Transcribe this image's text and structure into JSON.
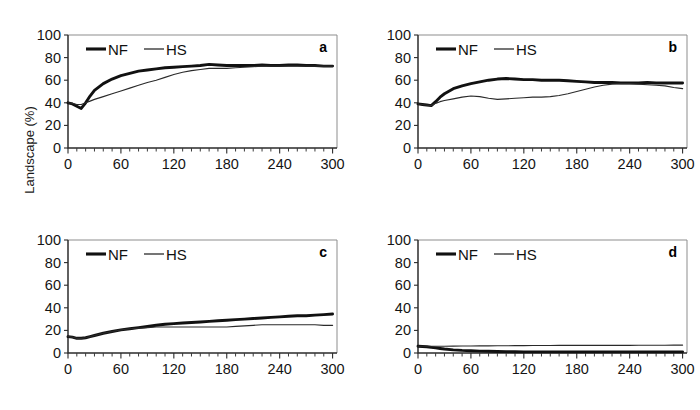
{
  "figure": {
    "ylabel": "Landscape (%)",
    "background_color": "#ffffff",
    "nf_color": "#111111",
    "hs_color": "#2a2a2a",
    "frame_color": "#8d8d8d"
  },
  "chart_data": [
    {
      "type": "line",
      "panel": "a",
      "title": "",
      "xlabel": "",
      "ylabel": "Landscape (%)",
      "xlim": [
        0,
        305
      ],
      "ylim": [
        0,
        100
      ],
      "xticks": [
        0,
        60,
        120,
        180,
        240,
        300
      ],
      "xtick_labels": [
        "0",
        "60",
        "120",
        "180",
        "240",
        "300"
      ],
      "xminor_step": 10,
      "yticks": [
        0,
        20,
        40,
        60,
        80,
        100
      ],
      "ytick_labels": [
        "0",
        "20",
        "40",
        "60",
        "80",
        "100"
      ],
      "grid": false,
      "legend_position": "top-left",
      "legend": [
        "NF",
        "HS"
      ],
      "x": [
        0,
        5,
        10,
        15,
        20,
        25,
        30,
        40,
        50,
        60,
        70,
        80,
        90,
        100,
        110,
        120,
        130,
        140,
        150,
        160,
        170,
        180,
        190,
        200,
        210,
        220,
        230,
        240,
        250,
        260,
        270,
        280,
        290,
        300
      ],
      "series": [
        {
          "name": "NF",
          "values": [
            40,
            39,
            37,
            35,
            40,
            46,
            51,
            57,
            61,
            64,
            66,
            68,
            69,
            70,
            71,
            71.5,
            72,
            72.5,
            73,
            74,
            73.5,
            73,
            73,
            73,
            73,
            73.5,
            73,
            73,
            73.5,
            73.5,
            73,
            73,
            72.5,
            72.5
          ]
        },
        {
          "name": "HS",
          "values": [
            40,
            39.5,
            38.5,
            38.5,
            40,
            41.5,
            43,
            45.5,
            48,
            50.5,
            53,
            55.5,
            58,
            60,
            62.5,
            65,
            67,
            68.5,
            69.5,
            70.5,
            70.5,
            70.5,
            71,
            71.5,
            72,
            72.5,
            72.5,
            72.5,
            72.5,
            72.5,
            72.5,
            72.5,
            72.5,
            72.5
          ]
        }
      ]
    },
    {
      "type": "line",
      "panel": "b",
      "title": "",
      "xlabel": "",
      "ylabel": "",
      "xlim": [
        0,
        305
      ],
      "ylim": [
        0,
        100
      ],
      "xticks": [
        0,
        60,
        120,
        180,
        240,
        300
      ],
      "xtick_labels": [
        "0",
        "60",
        "120",
        "180",
        "240",
        "300"
      ],
      "xminor_step": 10,
      "yticks": [
        0,
        20,
        40,
        60,
        80,
        100
      ],
      "ytick_labels": [
        "0",
        "20",
        "40",
        "60",
        "80",
        "100"
      ],
      "grid": false,
      "legend_position": "top-left",
      "legend": [
        "NF",
        "HS"
      ],
      "x": [
        0,
        5,
        10,
        15,
        20,
        25,
        30,
        40,
        50,
        60,
        70,
        80,
        90,
        100,
        110,
        120,
        130,
        140,
        150,
        160,
        170,
        180,
        190,
        200,
        210,
        220,
        230,
        240,
        250,
        260,
        270,
        280,
        290,
        300
      ],
      "series": [
        {
          "name": "NF",
          "values": [
            39,
            38.5,
            38,
            37.5,
            41,
            45,
            48,
            52.5,
            55,
            57,
            58.5,
            60,
            61,
            61.5,
            61,
            60.5,
            60.5,
            60,
            60,
            60,
            59.5,
            59,
            58.5,
            58,
            58,
            58,
            57.5,
            57.5,
            57.5,
            58,
            57.5,
            57.5,
            57.5,
            57.5
          ]
        },
        {
          "name": "HS",
          "values": [
            39,
            38.5,
            38,
            37.5,
            39.5,
            41,
            42,
            43.5,
            45,
            46,
            45.5,
            44,
            43,
            43.5,
            44,
            44.5,
            45,
            45,
            45.5,
            46.5,
            48,
            50,
            52,
            54,
            55.5,
            56.5,
            57,
            57,
            56.5,
            56,
            55.5,
            55,
            53.5,
            52.5
          ]
        }
      ]
    },
    {
      "type": "line",
      "panel": "c",
      "title": "",
      "xlabel": "",
      "ylabel": "",
      "xlim": [
        0,
        305
      ],
      "ylim": [
        0,
        100
      ],
      "xticks": [
        0,
        60,
        120,
        180,
        240,
        300
      ],
      "xtick_labels": [
        "0",
        "60",
        "120",
        "180",
        "240",
        "300"
      ],
      "xminor_step": 10,
      "yticks": [
        0,
        20,
        40,
        60,
        80,
        100
      ],
      "ytick_labels": [
        "0",
        "20",
        "40",
        "60",
        "80",
        "100"
      ],
      "grid": false,
      "legend_position": "top-left",
      "legend": [
        "NF",
        "HS"
      ],
      "x": [
        0,
        5,
        10,
        15,
        20,
        25,
        30,
        40,
        50,
        60,
        70,
        80,
        90,
        100,
        110,
        120,
        130,
        140,
        150,
        160,
        170,
        180,
        190,
        200,
        210,
        220,
        230,
        240,
        250,
        260,
        270,
        280,
        290,
        300
      ],
      "series": [
        {
          "name": "NF",
          "values": [
            14.5,
            14,
            13,
            13,
            13.5,
            14.5,
            15.5,
            17.5,
            19,
            20.5,
            21.5,
            22.5,
            23.5,
            24.5,
            25.5,
            26,
            26.5,
            27,
            27.5,
            28,
            28.5,
            29,
            29.5,
            30,
            30.5,
            31,
            31.5,
            32,
            32.5,
            33,
            33,
            33.5,
            34,
            34.5
          ]
        },
        {
          "name": "HS",
          "values": [
            14.5,
            14,
            13,
            13,
            13.5,
            14.5,
            15.5,
            17.5,
            19,
            20.5,
            21.5,
            22,
            22.5,
            23,
            23,
            23,
            23,
            23,
            23,
            23,
            23,
            23,
            23.5,
            24,
            24.5,
            25,
            25,
            25,
            25,
            25,
            25,
            25,
            24.5,
            24.5
          ]
        }
      ]
    },
    {
      "type": "line",
      "panel": "d",
      "title": "",
      "xlabel": "",
      "ylabel": "",
      "xlim": [
        0,
        305
      ],
      "ylim": [
        0,
        100
      ],
      "xticks": [
        0,
        60,
        120,
        180,
        240,
        300
      ],
      "xtick_labels": [
        "0",
        "60",
        "120",
        "180",
        "240",
        "300"
      ],
      "xminor_step": 10,
      "yticks": [
        0,
        20,
        40,
        60,
        80,
        100
      ],
      "ytick_labels": [
        "0",
        "20",
        "40",
        "60",
        "80",
        "100"
      ],
      "grid": false,
      "legend_position": "top-left",
      "legend": [
        "NF",
        "HS"
      ],
      "x": [
        0,
        5,
        10,
        15,
        20,
        25,
        30,
        40,
        50,
        60,
        70,
        80,
        90,
        100,
        110,
        120,
        130,
        140,
        150,
        160,
        170,
        180,
        190,
        200,
        210,
        220,
        230,
        240,
        250,
        260,
        270,
        280,
        290,
        300
      ],
      "series": [
        {
          "name": "NF",
          "values": [
            6,
            5.8,
            5.5,
            5,
            4.5,
            4,
            3.5,
            2.8,
            2.3,
            2,
            1.7,
            1.5,
            1.3,
            1.2,
            1.1,
            1,
            1,
            1,
            1,
            1,
            1,
            1,
            1,
            1,
            1,
            1,
            1,
            1,
            1,
            1,
            1,
            1,
            1,
            1
          ]
        },
        {
          "name": "HS",
          "values": [
            6,
            6,
            6,
            6,
            6,
            6,
            6,
            6.1,
            6.2,
            6.2,
            6.3,
            6.3,
            6.4,
            6.4,
            6.5,
            6.5,
            6.6,
            6.6,
            6.6,
            6.7,
            6.7,
            6.7,
            6.7,
            6.8,
            6.8,
            6.8,
            6.8,
            6.8,
            6.9,
            6.9,
            6.9,
            6.9,
            7,
            7
          ]
        }
      ]
    }
  ]
}
